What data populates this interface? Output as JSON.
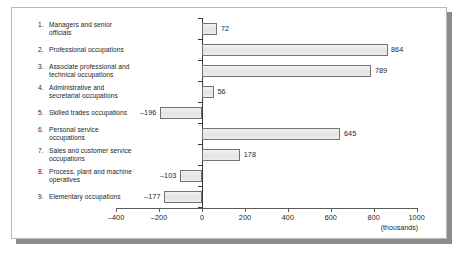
{
  "chart_data": {
    "type": "bar",
    "orientation": "horizontal",
    "title": "",
    "xlabel": "(thousands)",
    "ylabel": "",
    "grid": false,
    "legend": null,
    "xlim": [
      -400,
      1000
    ],
    "xticks": [
      -400,
      -200,
      0,
      200,
      400,
      600,
      800,
      1000
    ],
    "xtick_labels": [
      "–400",
      "–200",
      "0",
      "200",
      "400",
      "600",
      "800",
      "1000"
    ],
    "categories": [
      "Managers and senior officials",
      "Professional occupations",
      "Associate professional and technical occupations",
      "Administrative and secretarial occupations",
      "Skilled trades occupations",
      "Personal service occupations",
      "Sales and customer service occupations",
      "Process, plant and machine operatives",
      "Elementary occupations"
    ],
    "values": [
      72,
      864,
      789,
      56,
      -196,
      645,
      178,
      -103,
      -177
    ],
    "value_labels": [
      "72",
      "864",
      "789",
      "56",
      "–196",
      "645",
      "178",
      "–103",
      "–177"
    ],
    "bar_fill": "#e8e8e8",
    "bar_stroke": "#737373"
  },
  "axis": {
    "unit_label": "(thousands)"
  },
  "rows": [
    {
      "num": "1.",
      "line1": "Managers and senior",
      "line2": "officials"
    },
    {
      "num": "2.",
      "line1": "Professional occupations",
      "line2": ""
    },
    {
      "num": "3.",
      "line1": "Associate professional and",
      "line2": "technical occupations"
    },
    {
      "num": "4.",
      "line1": "Administrative and",
      "line2": "secretarial occupations"
    },
    {
      "num": "5.",
      "line1": "Skilled trades occupations",
      "line2": ""
    },
    {
      "num": "6.",
      "line1": "Personal service",
      "line2": "occupations"
    },
    {
      "num": "7.",
      "line1": "Sales and customer service",
      "line2": "occupations"
    },
    {
      "num": "8.",
      "line1": "Process, plant and machine",
      "line2": "operatives"
    },
    {
      "num": "9.",
      "line1": "Elementary occupations",
      "line2": ""
    }
  ]
}
